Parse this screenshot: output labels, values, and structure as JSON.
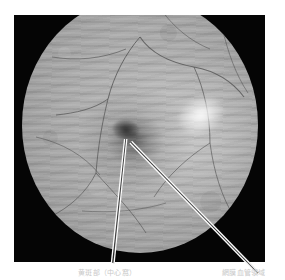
{
  "figure": {
    "kind": "retinal-fundus-photograph",
    "modality_label": "fundus photograph",
    "plate": {
      "background_color": "#050505",
      "x": 14,
      "y": 15,
      "width": 251,
      "height": 247
    },
    "fundus": {
      "base_color": "#ababab",
      "rim_color": "#7c7c7c",
      "highlight_color": "#ffffff",
      "vessel_color": "#4a4a4a",
      "shape": "circle-clipped-at-top"
    },
    "features": [
      {
        "name": "macula-fovea",
        "appearance": "dark-oval",
        "x_pct": 44,
        "y_pct": 52
      },
      {
        "name": "specular-reflex",
        "appearance": "bright-white-oval",
        "x_pct": 76,
        "y_pct": 46
      }
    ],
    "pointers": [
      {
        "name": "pointer-left",
        "target": "macula-fovea",
        "style": "white-double-line"
      },
      {
        "name": "pointer-right",
        "target": "macula-fovea",
        "style": "white-double-line"
      }
    ]
  },
  "caption": {
    "left_label": "黄斑部（中心窩）",
    "right_label": "網膜血管領域"
  }
}
